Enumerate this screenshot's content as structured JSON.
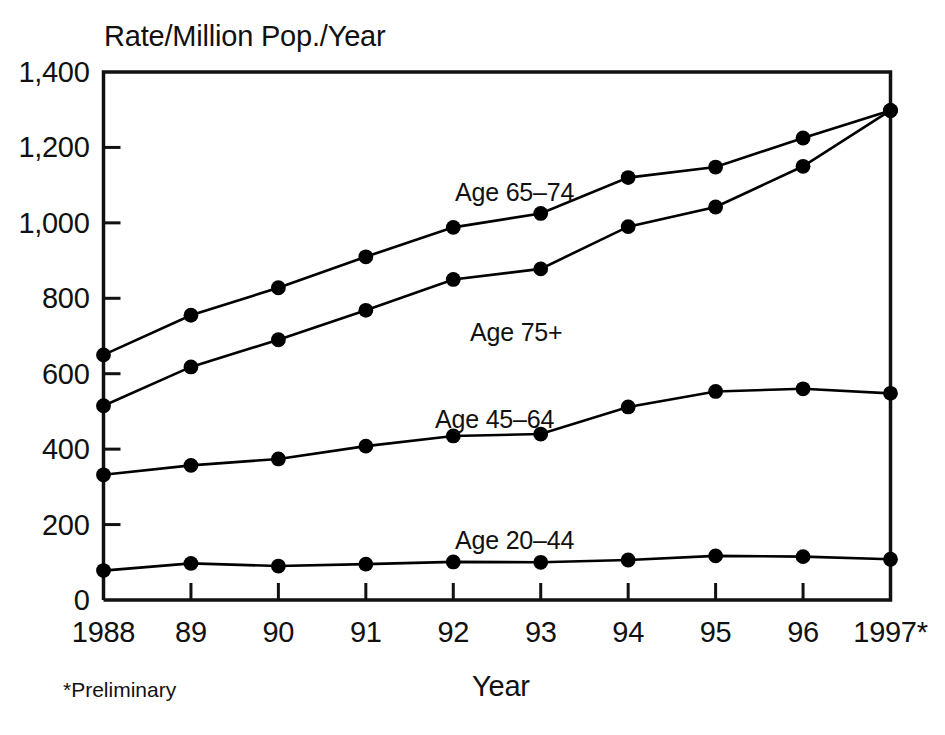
{
  "chart_data": {
    "type": "line",
    "title": "",
    "ylabel": "Rate/Million Pop./Year",
    "xlabel": "Year",
    "x": [
      "1988",
      "89",
      "90",
      "91",
      "92",
      "93",
      "94",
      "95",
      "96",
      "1997*"
    ],
    "x_values": [
      1988,
      1989,
      1990,
      1991,
      1992,
      1993,
      1994,
      1995,
      1996,
      1997
    ],
    "xlim": [
      1988,
      1997
    ],
    "ylim": [
      0,
      1400
    ],
    "y_ticks": [
      0,
      200,
      400,
      600,
      800,
      1000,
      1200,
      1400
    ],
    "y_tick_labels": [
      "0",
      "200",
      "400",
      "600",
      "800",
      "1,000",
      "1,200",
      "1,400"
    ],
    "grid": false,
    "legend_position": "inline-annotations",
    "markers": "filled-circle",
    "line_color": "#000000",
    "series": [
      {
        "name": "Age 65-74",
        "label": "Age 65–74",
        "values": [
          650,
          755,
          828,
          910,
          988,
          1025,
          1120,
          1148,
          1225,
          1298
        ]
      },
      {
        "name": "Age 75+",
        "label": "Age 75+",
        "values": [
          515,
          618,
          690,
          768,
          850,
          878,
          990,
          1042,
          1150,
          1298
        ]
      },
      {
        "name": "Age 45-64",
        "label": "Age 45–64",
        "values": [
          332,
          357,
          374,
          408,
          435,
          440,
          512,
          553,
          560,
          548
        ]
      },
      {
        "name": "Age 20-44",
        "label": "Age 20–44",
        "values": [
          78,
          97,
          90,
          95,
          101,
          100,
          106,
          117,
          115,
          108
        ]
      }
    ],
    "annotations": [
      {
        "text": "Age 65–74",
        "x_px": 455,
        "y_px": 178
      },
      {
        "text": "Age 75+",
        "x_px": 470,
        "y_px": 318
      },
      {
        "text": "Age 45–64",
        "x_px": 435,
        "y_px": 405
      },
      {
        "text": "Age 20–44",
        "x_px": 455,
        "y_px": 526
      }
    ],
    "footnote": "*Preliminary"
  },
  "figure": {
    "y_axis_title": "Rate/Million Pop./Year",
    "x_axis_title": "Year",
    "footnote": "*Preliminary",
    "caption_partial": ""
  }
}
